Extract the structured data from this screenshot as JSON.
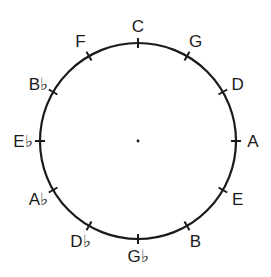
{
  "diagram": {
    "center": {
      "x": 138,
      "y": 141
    },
    "radius": 98,
    "stroke_color": "#1a1a1a",
    "notes": [
      {
        "label": "C",
        "angle": 0
      },
      {
        "label": "G",
        "angle": 30
      },
      {
        "label": "D",
        "angle": 60
      },
      {
        "label": "A",
        "angle": 90
      },
      {
        "label": "E",
        "angle": 120
      },
      {
        "label": "B",
        "angle": 150
      },
      {
        "label": "G♭",
        "angle": 180
      },
      {
        "label": "D♭",
        "angle": 210
      },
      {
        "label": "A♭",
        "angle": 240
      },
      {
        "label": "E♭",
        "angle": 270
      },
      {
        "label": "B♭",
        "angle": 300
      },
      {
        "label": "F",
        "angle": 330
      }
    ]
  }
}
